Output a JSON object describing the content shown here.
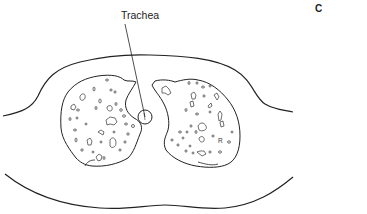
{
  "figure": {
    "panel_letter": "C",
    "labels": {
      "trachea": "Trachea"
    },
    "lung_markers": {
      "right_lung_letter": "R"
    },
    "colors": {
      "line": "#222222",
      "background": "#ffffff"
    },
    "structures": [
      "body-outline-upper",
      "body-outline-lower",
      "left-lung",
      "right-lung",
      "trachea"
    ]
  }
}
